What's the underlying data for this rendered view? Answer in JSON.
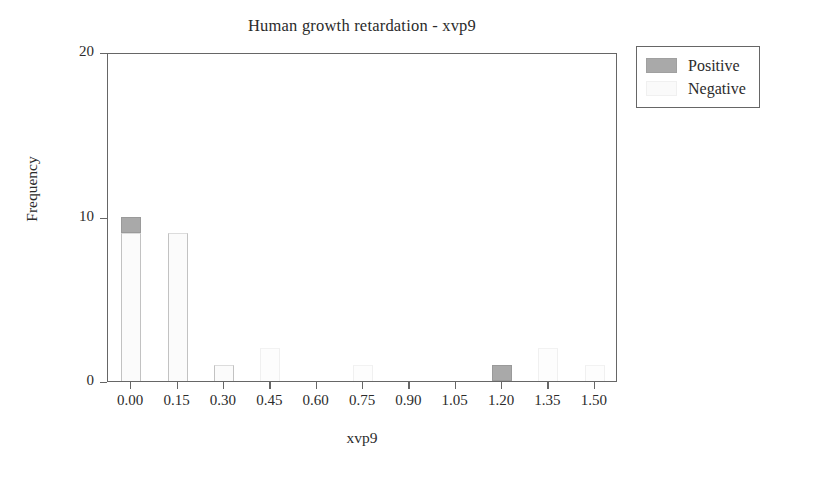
{
  "chart_data": {
    "type": "bar",
    "title": "Human growth retardation - xvp9",
    "xlabel": "xvp9",
    "ylabel": "Frequency",
    "xlim": [
      -0.075,
      1.575
    ],
    "ylim": [
      0,
      20
    ],
    "grid": false,
    "stacked": true,
    "legend_position": "outside-right-top",
    "xticks": [
      "0.00",
      "0.15",
      "0.30",
      "0.45",
      "0.60",
      "0.75",
      "0.90",
      "1.05",
      "1.20",
      "1.35",
      "1.50"
    ],
    "xtick_values": [
      0.0,
      0.15,
      0.3,
      0.45,
      0.6,
      0.75,
      0.9,
      1.05,
      1.2,
      1.35,
      1.5
    ],
    "yticks": [
      "0",
      "10",
      "20"
    ],
    "ytick_values": [
      0,
      10,
      20
    ],
    "categories": [
      0.0,
      0.15,
      0.3,
      0.45,
      0.6,
      0.75,
      0.9,
      1.05,
      1.2,
      1.35,
      1.5
    ],
    "series": [
      {
        "name": "Positive",
        "color": "#a9a9a9",
        "values": [
          1,
          0,
          0,
          0,
          0,
          0,
          0,
          0,
          1,
          0,
          0
        ]
      },
      {
        "name": "Negative",
        "color": "#fafafa",
        "values": [
          9,
          9,
          1,
          2,
          0,
          1,
          0,
          0,
          0,
          2,
          1
        ]
      }
    ],
    "bars": [
      {
        "x": "0.00",
        "total": 10,
        "positive": 1,
        "negative": 9,
        "faint": false
      },
      {
        "x": "0.15",
        "total": 9,
        "positive": 0,
        "negative": 9,
        "faint": false
      },
      {
        "x": "0.30",
        "total": 1,
        "positive": 0,
        "negative": 1,
        "faint": false
      },
      {
        "x": "0.45",
        "total": 2,
        "positive": 0,
        "negative": 2,
        "faint": true
      },
      {
        "x": "0.75",
        "total": 1,
        "positive": 0,
        "negative": 1,
        "faint": true
      },
      {
        "x": "1.20",
        "total": 1,
        "positive": 1,
        "negative": 0,
        "faint": false
      },
      {
        "x": "1.35",
        "total": 2,
        "positive": 0,
        "negative": 2,
        "faint": true
      },
      {
        "x": "1.50",
        "total": 1,
        "positive": 0,
        "negative": 1,
        "faint": true
      }
    ]
  },
  "legend": {
    "items": [
      {
        "label": "Positive",
        "swatch": "positive-swatch"
      },
      {
        "label": "Negative",
        "swatch": "negative-swatch"
      }
    ]
  }
}
